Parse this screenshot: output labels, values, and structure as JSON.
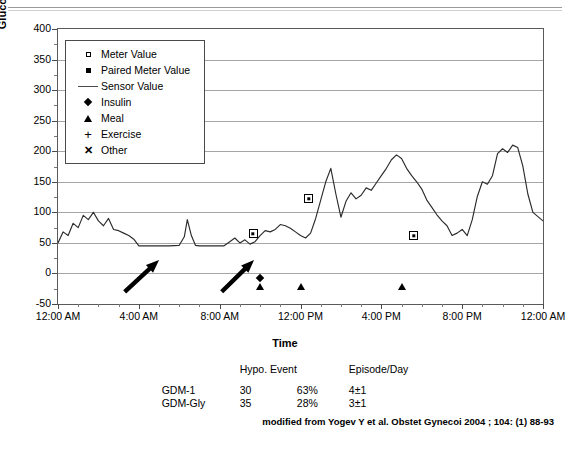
{
  "top_clipped_text": "",
  "chart_data": {
    "type": "line",
    "title": "",
    "xlabel": "Time",
    "ylabel": "Glucose Concentration (mg/dL)",
    "ylim": [
      -50,
      400
    ],
    "yticks": [
      400,
      350,
      300,
      250,
      200,
      150,
      100,
      50,
      0,
      -50
    ],
    "ytick_labels": [
      "400",
      "350",
      "300",
      "250",
      "200",
      "150",
      "100",
      "50",
      "0",
      "-50"
    ],
    "xlim_hours": [
      0,
      24
    ],
    "xticks_hours": [
      0,
      4,
      8,
      12,
      16,
      20,
      24
    ],
    "xtick_labels": [
      "12:00 AM",
      "4:00 AM",
      "8:00 AM",
      "12:00 PM",
      "4:00 PM",
      "8:00 PM",
      "12:00 AM"
    ],
    "x_minor_interval_hours": 1,
    "grid": true,
    "grid_axis": "y",
    "legend_position": "upper-left-inside",
    "legend": [
      {
        "label": "Meter Value",
        "symbol": "open-square"
      },
      {
        "label": "Paired Meter Value",
        "symbol": "filled-square"
      },
      {
        "label": "Sensor Value",
        "symbol": "line"
      },
      {
        "label": "Insulin",
        "symbol": "diamond"
      },
      {
        "label": "Meal",
        "symbol": "triangle"
      },
      {
        "label": "Exercise",
        "symbol": "plus"
      },
      {
        "label": "Other",
        "symbol": "x"
      }
    ],
    "series": [
      {
        "name": "Sensor Value",
        "type": "line",
        "x_hours": [
          0,
          0.25,
          0.5,
          0.75,
          1.0,
          1.25,
          1.5,
          1.75,
          2.0,
          2.25,
          2.5,
          2.75,
          3.0,
          3.25,
          3.5,
          3.75,
          4.0,
          4.25,
          4.5,
          4.75,
          5.0,
          5.5,
          6.0,
          6.25,
          6.4,
          6.6,
          6.8,
          7.0,
          7.4,
          7.8,
          8.2,
          8.5,
          8.75,
          9.0,
          9.25,
          9.5,
          9.75,
          10.0,
          10.25,
          10.5,
          10.75,
          11.0,
          11.25,
          11.5,
          11.75,
          12.0,
          12.25,
          12.5,
          12.75,
          13.0,
          13.25,
          13.5,
          13.75,
          14.0,
          14.25,
          14.5,
          14.75,
          15.0,
          15.25,
          15.5,
          15.75,
          16.0,
          16.25,
          16.5,
          16.75,
          17.0,
          17.25,
          17.5,
          17.75,
          18.0,
          18.25,
          18.5,
          18.75,
          19.0,
          19.25,
          19.5,
          19.75,
          20.0,
          20.25,
          20.5,
          20.75,
          21.0,
          21.25,
          21.5,
          21.75,
          22.0,
          22.25,
          22.5,
          22.75,
          23.0,
          23.25,
          23.5,
          24.0
        ],
        "y_values": [
          50,
          68,
          62,
          82,
          75,
          95,
          88,
          100,
          86,
          78,
          90,
          72,
          70,
          66,
          62,
          56,
          45,
          45,
          45,
          45,
          45,
          45,
          46,
          60,
          88,
          62,
          46,
          45,
          45,
          45,
          45,
          52,
          58,
          50,
          55,
          48,
          52,
          62,
          70,
          68,
          72,
          80,
          78,
          74,
          68,
          62,
          58,
          66,
          90,
          120,
          150,
          172,
          130,
          92,
          118,
          132,
          122,
          128,
          140,
          136,
          148,
          160,
          172,
          186,
          194,
          188,
          172,
          160,
          150,
          138,
          120,
          108,
          96,
          86,
          78,
          62,
          66,
          72,
          62,
          88,
          126,
          150,
          146,
          160,
          196,
          204,
          198,
          210,
          206,
          176,
          130,
          100,
          86
        ]
      }
    ],
    "paired_meter_values": [
      {
        "time": "9:40 AM",
        "x_hours": 9.65,
        "value": 65
      },
      {
        "time": "12:25 PM",
        "x_hours": 12.4,
        "value": 122
      },
      {
        "time": "5:40 PM",
        "x_hours": 17.6,
        "value": 62
      }
    ],
    "events": [
      {
        "kind": "Insulin",
        "symbol": "diamond",
        "x_hours": 10.0,
        "y_value": -8
      },
      {
        "kind": "Meal",
        "symbol": "triangle",
        "x_hours": 10.0,
        "y_value": -22
      },
      {
        "kind": "Meal",
        "symbol": "triangle",
        "x_hours": 12.0,
        "y_value": -22
      },
      {
        "kind": "Meal",
        "symbol": "triangle",
        "x_hours": 17.0,
        "y_value": -22
      }
    ],
    "annotations": [
      {
        "type": "arrow",
        "label": "hypoglycemia-arrow-1",
        "from_hours": 3.3,
        "from_value": -30,
        "to_hours": 5.0,
        "to_value": 22
      },
      {
        "type": "arrow",
        "label": "hypoglycemia-arrow-2",
        "from_hours": 8.1,
        "from_value": -30,
        "to_hours": 9.7,
        "to_value": 22
      }
    ]
  },
  "table": {
    "headers": [
      "",
      "Hypo. Event",
      "",
      "Episode/Day"
    ],
    "header_hypo": "Hypo. Event",
    "header_episode": "Episode/Day",
    "rows": [
      {
        "label": "GDM-1",
        "hypo_event": "30",
        "percent": "63%",
        "episode_day": "4±1"
      },
      {
        "label": "GDM-Gly",
        "hypo_event": "35",
        "percent": "28%",
        "episode_day": "3±1"
      }
    ]
  },
  "citation": "modified from Yogev Y et al. Obstet Gynecoi 2004 ; 104: (1) 88-93"
}
